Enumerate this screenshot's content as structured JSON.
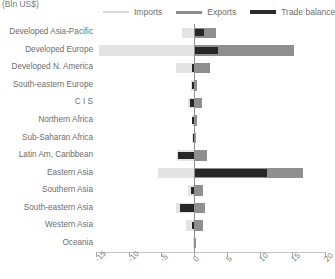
{
  "units_label": "(Bln US$)",
  "legend": {
    "position": "top",
    "items": [
      {
        "label": "Imports",
        "key": "imports",
        "color": "#e3e3e3"
      },
      {
        "label": "Exports",
        "key": "exports",
        "color": "#8f8f8f"
      },
      {
        "label": "Trade balance",
        "key": "balance",
        "color": "#262626"
      }
    ]
  },
  "chart_data": {
    "type": "bar",
    "orientation": "horizontal",
    "title": "",
    "subtitle": "",
    "xlabel": "(Bln US$)",
    "ylabel": "",
    "xlim": [
      -15,
      20
    ],
    "xticks": [
      -15,
      -10,
      -5,
      0,
      5,
      10,
      15,
      20
    ],
    "xticklabels": [
      "-15",
      "-10",
      "-5",
      "0",
      "5",
      "10",
      "15",
      "20"
    ],
    "grid": false,
    "legend_entries": [
      "Imports",
      "Exports",
      "Trade balance"
    ],
    "categories": [
      "Developed Asia-Pacific",
      "Developed Europe",
      "Developed N. America",
      "South-eastern Europe",
      "C I S",
      "Northern Africa",
      "Sub-Saharan Africa",
      "Latin Am, Caribbean",
      "Eastern Asia",
      "Southern Asia",
      "South-eastern Asia",
      "Western Asia",
      "Oceania"
    ],
    "series": [
      {
        "name": "Imports",
        "color": "#e3e3e3",
        "values": [
          -1.9,
          -14.6,
          -2.8,
          -0.5,
          -0.9,
          -0.3,
          -0.4,
          -2.6,
          -5.5,
          -1.0,
          -2.7,
          -1.2,
          -0.1
        ]
      },
      {
        "name": "Exports",
        "color": "#8f8f8f",
        "values": [
          3.4,
          15.3,
          2.5,
          0.5,
          1.2,
          0.4,
          0.3,
          1.9,
          16.6,
          1.3,
          1.6,
          1.4,
          0.1
        ]
      },
      {
        "name": "Trade balance",
        "color": "#262626",
        "values": [
          1.5,
          3.6,
          -0.3,
          -0.4,
          -0.6,
          -0.3,
          -0.2,
          -2.5,
          11.1,
          -0.5,
          -2.2,
          -0.3,
          0.0
        ]
      }
    ]
  }
}
